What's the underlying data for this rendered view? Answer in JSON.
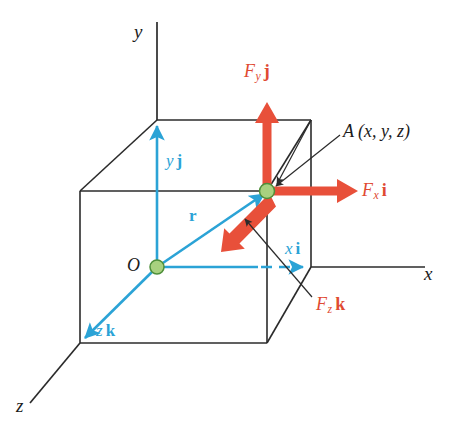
{
  "figure": {
    "type": "vector-diagram"
  },
  "colors": {
    "force_red": "#e04a32",
    "vector_blue": "#2ba3d6",
    "point_green_fill": "#a8d17f",
    "point_green_stroke": "#4e8f3a",
    "line_black": "#2b2b2b",
    "background": "#ffffff"
  },
  "axes": {
    "y_label": "y",
    "x_label": "x",
    "z_label": "z"
  },
  "points": {
    "origin_label": "O",
    "point_a_label": "A",
    "point_a_coords": "(x, y, z)",
    "point_a_full": "A (x, y, z)"
  },
  "force_components": [
    {
      "name": "force-y-component",
      "label_main": "F",
      "label_sub": "y",
      "label_unit": "j",
      "direction": "up",
      "color": "#e04a32"
    },
    {
      "name": "force-x-component",
      "label_main": "F",
      "label_sub": "x",
      "label_unit": "i",
      "direction": "right",
      "color": "#e04a32"
    },
    {
      "name": "force-z-component",
      "label_main": "F",
      "label_sub": "z",
      "label_unit": "k",
      "direction": "down-left",
      "color": "#e04a32"
    }
  ],
  "position_vectors": [
    {
      "name": "position-vector-r",
      "label": "r",
      "color": "#2ba3d6"
    },
    {
      "name": "component-y-vector",
      "label_main": "y",
      "label_unit": "j",
      "color": "#2ba3d6"
    },
    {
      "name": "component-x-vector",
      "label_main": "x",
      "label_unit": "i",
      "color": "#2ba3d6"
    },
    {
      "name": "component-z-vector",
      "label_main": "z",
      "label_unit": "k",
      "color": "#2ba3d6"
    }
  ],
  "geometry": {
    "box_description": "wireframe rectangular box showing coordinate decomposition",
    "origin_px": [
      157,
      267
    ],
    "point_a_px": [
      267,
      191
    ]
  }
}
